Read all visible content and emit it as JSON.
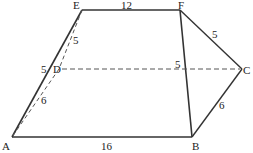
{
  "points": {
    "A": {
      "label": "A",
      "x": 12,
      "y": 137
    },
    "B": {
      "label": "B",
      "x": 192,
      "y": 137
    },
    "C": {
      "label": "C",
      "x": 242,
      "y": 69
    },
    "D": {
      "label": "D",
      "x": 59,
      "y": 69
    },
    "E": {
      "label": "E",
      "x": 82,
      "y": 10
    },
    "F": {
      "label": "F",
      "x": 180,
      "y": 10
    }
  },
  "segments": {
    "EF": "12",
    "AB": "16",
    "FC": "5",
    "CB": "6",
    "ED": "5",
    "DA": "6",
    "AD_left": "5",
    "F_mid": "5"
  }
}
